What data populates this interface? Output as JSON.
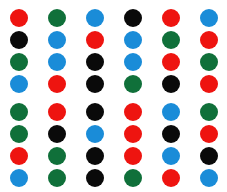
{
  "canvas": {
    "width": 227,
    "height": 192,
    "background": "#ffffff"
  },
  "palette": {
    "red": "#ee1410",
    "green": "#10703a",
    "blue": "#1a8cd8",
    "black": "#0a0a0a"
  },
  "grid": {
    "columns": 6,
    "rows": 8,
    "dot_diameter": 18,
    "column_centers": [
      19,
      57,
      95,
      133,
      171,
      209
    ],
    "row_centers": [
      18,
      40,
      62,
      84,
      112,
      134,
      156,
      178
    ],
    "group_gap_after_row": 4
  },
  "chart_data": {
    "type": "heatmap",
    "title": "",
    "xlabel": "",
    "ylabel": "",
    "categories": [
      "c1",
      "c2",
      "c3",
      "c4",
      "c5",
      "c6"
    ],
    "row_labels": [
      "r1",
      "r2",
      "r3",
      "r4",
      "r5",
      "r6",
      "r7",
      "r8"
    ],
    "legend": [
      "red",
      "green",
      "blue",
      "black"
    ],
    "grid": false,
    "cells": [
      [
        "red",
        "green",
        "blue",
        "black",
        "red",
        "blue"
      ],
      [
        "black",
        "blue",
        "red",
        "blue",
        "green",
        "red"
      ],
      [
        "green",
        "blue",
        "black",
        "blue",
        "red",
        "green"
      ],
      [
        "blue",
        "red",
        "black",
        "green",
        "black",
        "red"
      ],
      [
        "green",
        "red",
        "black",
        "red",
        "blue",
        "green"
      ],
      [
        "green",
        "black",
        "blue",
        "red",
        "black",
        "red"
      ],
      [
        "red",
        "green",
        "black",
        "red",
        "blue",
        "black"
      ],
      [
        "blue",
        "green",
        "black",
        "green",
        "red",
        "blue"
      ]
    ],
    "counts": {
      "red": 13,
      "green": 11,
      "blue": 11,
      "black": 13,
      "total": 48
    }
  }
}
